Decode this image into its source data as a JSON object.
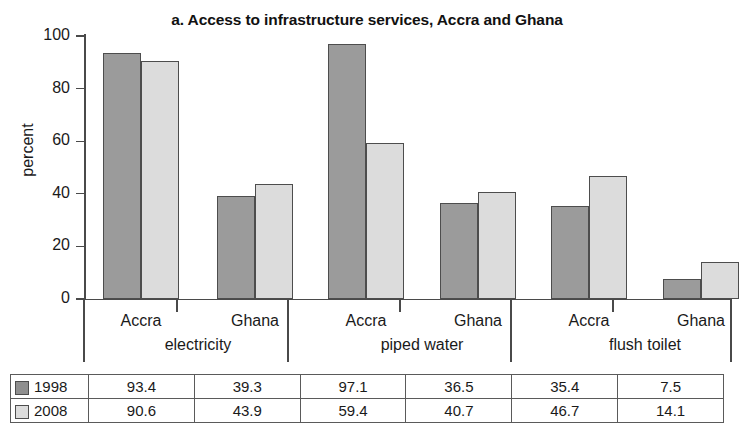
{
  "chart_data": {
    "type": "bar",
    "title": "a. Access to infrastructure services, Accra and Ghana",
    "xlabel": "",
    "ylabel": "percent",
    "ylim": [
      0,
      100
    ],
    "yticks": [
      0,
      20,
      40,
      60,
      80,
      100
    ],
    "grid": false,
    "legend_position": "table-left",
    "groups": [
      "electricity",
      "piped water",
      "flush toilet"
    ],
    "subcategories": [
      "Accra",
      "Ghana"
    ],
    "categories": [
      "electricity - Accra",
      "electricity - Ghana",
      "piped water - Accra",
      "piped water - Ghana",
      "flush toilet - Accra",
      "flush toilet - Ghana"
    ],
    "series": [
      {
        "name": "1998",
        "color": "#9b9b9b",
        "values": [
          93.4,
          39.3,
          97.1,
          36.5,
          35.4,
          7.5
        ]
      },
      {
        "name": "2008",
        "color": "#dcdcdc",
        "values": [
          90.6,
          43.9,
          59.4,
          40.7,
          46.7,
          14.1
        ]
      }
    ]
  },
  "table": {
    "rows": [
      {
        "label": "1998",
        "swatch": "swatch-1998",
        "values": [
          "93.4",
          "39.3",
          "97.1",
          "36.5",
          "35.4",
          "7.5"
        ]
      },
      {
        "label": "2008",
        "swatch": "swatch-2008",
        "values": [
          "90.6",
          "43.9",
          "59.4",
          "40.7",
          "46.7",
          "14.1"
        ]
      }
    ]
  },
  "axis": {
    "y_title": "percent",
    "y_tick_labels": [
      "100",
      "80",
      "60",
      "40",
      "20",
      "0"
    ],
    "x_sub_labels": [
      "Accra",
      "Ghana",
      "Accra",
      "Ghana",
      "Accra",
      "Ghana"
    ],
    "x_group_labels": [
      "electricity",
      "piped water",
      "flush toilet"
    ]
  }
}
